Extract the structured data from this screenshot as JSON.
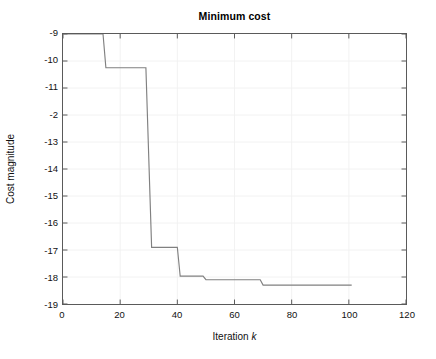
{
  "chart_data": {
    "type": "line",
    "title": "Minimum cost",
    "xlabel": "Iteration",
    "xlabel_variable": "k",
    "ylabel": "Cost magnitude",
    "xlim": [
      0,
      120
    ],
    "ylim": [
      -19,
      -9
    ],
    "grid": true,
    "legend": null,
    "line_color": "#808080",
    "axis_color": "#5a5a5a",
    "grid_color": "#f2f2f2",
    "xticks": [
      0,
      20,
      40,
      60,
      80,
      100,
      120
    ],
    "xtick_labels": [
      "0",
      "20",
      "40",
      "60",
      "80",
      "100",
      "120"
    ],
    "yticks": [
      -9,
      -10,
      -11,
      -12,
      -13,
      -14,
      -15,
      -16,
      -17,
      -18,
      -19
    ],
    "ytick_labels": [
      "-9",
      "-10",
      "-11",
      "-2",
      "-13",
      "-14",
      "-15",
      "-16",
      "-17",
      "-18",
      "-19"
    ],
    "series": [
      {
        "name": "minimum cost",
        "step": "post",
        "x": [
          0,
          14,
          15,
          29,
          31,
          40,
          41,
          49,
          50,
          69,
          70,
          101
        ],
        "y": [
          -9.0,
          -9.0,
          -10.25,
          -10.25,
          -16.9,
          -16.9,
          -17.97,
          -17.97,
          -18.1,
          -18.1,
          -18.3,
          -18.3
        ]
      }
    ],
    "annotations": []
  }
}
